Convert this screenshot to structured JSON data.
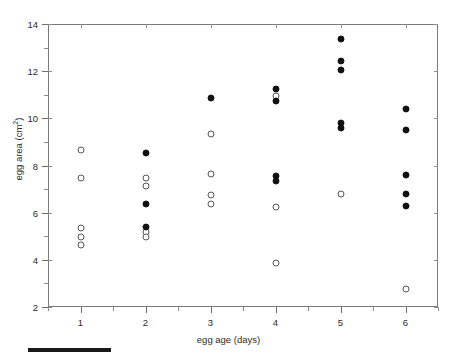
{
  "figure": {
    "background_color": "#ffffff",
    "axis_color": "#7a7a7a",
    "marker_filled_color": "#111111",
    "marker_open_color": "#555555"
  },
  "axes": {
    "x_title": "egg age (days)",
    "y_title_main": "egg area (cm",
    "y_title_sup": "2",
    "y_title_close": ")",
    "x_ticks": [
      "1",
      "2",
      "3",
      "4",
      "5",
      "6"
    ],
    "y_ticks": [
      "2",
      "4",
      "6",
      "8",
      "10",
      "12",
      "14"
    ]
  },
  "chart_data": {
    "type": "scatter",
    "title": "",
    "xlabel": "egg age (days)",
    "ylabel": "egg area (cm^2)",
    "xlim": [
      0.5,
      6.5
    ],
    "ylim": [
      2,
      14
    ],
    "x_tick_values": [
      1,
      2,
      3,
      4,
      5,
      6
    ],
    "y_tick_values": [
      2,
      4,
      6,
      8,
      10,
      12,
      14
    ],
    "y_minor_tick_values": [
      3,
      5,
      7,
      9,
      11,
      13
    ],
    "grid": false,
    "legend": null,
    "series": [
      {
        "name": "open circles",
        "marker": "open-circle",
        "color": "#555555",
        "points": [
          {
            "x": 1,
            "y": 8.65
          },
          {
            "x": 1,
            "y": 7.45
          },
          {
            "x": 1,
            "y": 5.35
          },
          {
            "x": 1,
            "y": 4.95
          },
          {
            "x": 1,
            "y": 4.65
          },
          {
            "x": 2,
            "y": 7.45
          },
          {
            "x": 2,
            "y": 7.15
          },
          {
            "x": 2,
            "y": 5.2
          },
          {
            "x": 2,
            "y": 4.95
          },
          {
            "x": 3,
            "y": 9.35
          },
          {
            "x": 3,
            "y": 7.65
          },
          {
            "x": 3,
            "y": 6.75
          },
          {
            "x": 3,
            "y": 6.35
          },
          {
            "x": 4,
            "y": 10.95
          },
          {
            "x": 4,
            "y": 6.25
          },
          {
            "x": 4,
            "y": 3.85
          },
          {
            "x": 5,
            "y": 6.8
          },
          {
            "x": 6,
            "y": 2.75
          }
        ]
      },
      {
        "name": "filled circles",
        "marker": "filled-circle",
        "color": "#111111",
        "points": [
          {
            "x": 2,
            "y": 8.55
          },
          {
            "x": 2,
            "y": 6.35
          },
          {
            "x": 2,
            "y": 5.4
          },
          {
            "x": 3,
            "y": 10.85
          },
          {
            "x": 4,
            "y": 11.25
          },
          {
            "x": 4,
            "y": 10.75
          },
          {
            "x": 4,
            "y": 7.55
          },
          {
            "x": 4,
            "y": 7.35
          },
          {
            "x": 5,
            "y": 13.35
          },
          {
            "x": 5,
            "y": 12.45
          },
          {
            "x": 5,
            "y": 12.05
          },
          {
            "x": 5,
            "y": 9.8
          },
          {
            "x": 5,
            "y": 9.6
          },
          {
            "x": 6,
            "y": 10.4
          },
          {
            "x": 6,
            "y": 9.5
          },
          {
            "x": 6,
            "y": 7.6
          },
          {
            "x": 6,
            "y": 6.8
          },
          {
            "x": 6,
            "y": 6.3
          }
        ]
      }
    ]
  }
}
